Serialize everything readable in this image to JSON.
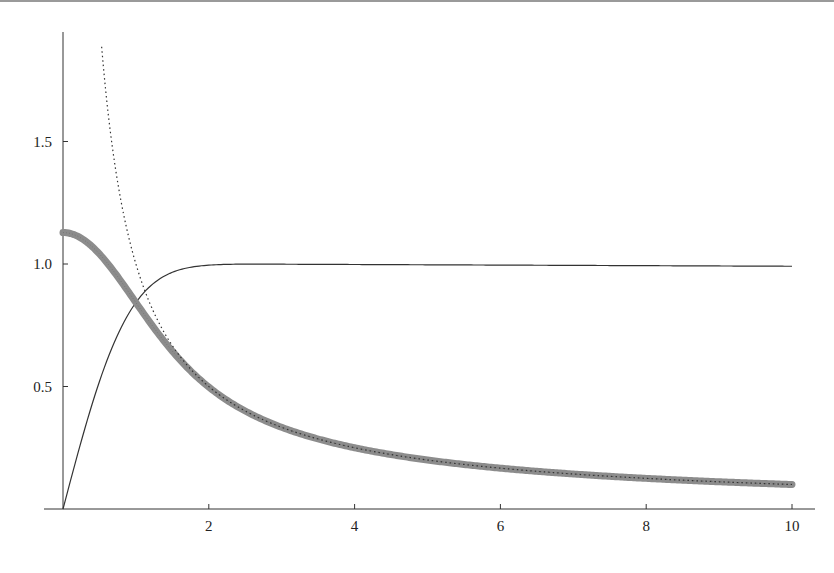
{
  "chart_data": {
    "type": "line",
    "title": "",
    "xlabel": "",
    "ylabel": "",
    "xlim": [
      0,
      10
    ],
    "ylim": [
      0,
      1.9
    ],
    "grid": false,
    "legend": null,
    "x_ticks": [
      "2",
      "4",
      "6",
      "8",
      "10"
    ],
    "y_ticks": [
      "0.5",
      "1.0",
      "1.5"
    ],
    "x_tick_values": [
      2,
      4,
      6,
      8,
      10
    ],
    "y_tick_values": [
      0.5,
      1.0,
      1.5
    ],
    "series": [
      {
        "name": "erf(x)",
        "style": "solid thin",
        "color": "#333333",
        "x": [
          0,
          0.25,
          0.5,
          0.75,
          1,
          1.25,
          1.5,
          2,
          2.5,
          3,
          4,
          6,
          8,
          10
        ],
        "values": [
          0,
          0.276,
          0.52,
          0.711,
          0.843,
          0.923,
          0.966,
          0.995,
          1.0,
          1.0,
          1.0,
          1.0,
          1.0,
          0.99
        ]
      },
      {
        "name": "erf(x)/x",
        "style": "thick gray",
        "color": "#8c8c8c",
        "x": [
          0,
          0.25,
          0.5,
          0.75,
          1,
          1.5,
          2,
          3,
          4,
          5,
          6,
          7,
          8,
          9,
          10
        ],
        "values": [
          1.128,
          1.104,
          1.041,
          0.948,
          0.843,
          0.644,
          0.498,
          0.333,
          0.25,
          0.2,
          0.167,
          0.143,
          0.125,
          0.111,
          0.1
        ]
      },
      {
        "name": "1/x",
        "style": "dotted",
        "color": "#333333",
        "x": [
          0.53,
          0.75,
          1,
          1.5,
          2,
          3,
          4,
          6,
          8,
          10
        ],
        "values": [
          1.9,
          1.333,
          1.0,
          0.667,
          0.5,
          0.333,
          0.25,
          0.167,
          0.125,
          0.1
        ]
      }
    ]
  }
}
